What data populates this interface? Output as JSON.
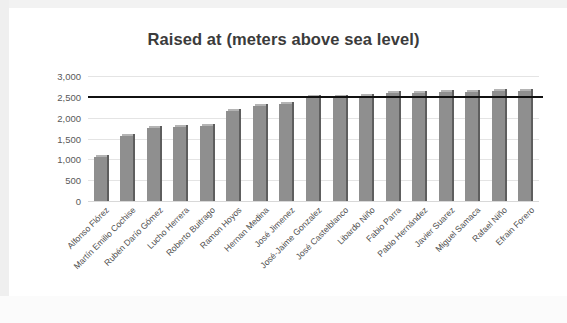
{
  "chart_data": {
    "type": "bar",
    "title": "Raised at (meters above sea level)",
    "xlabel": "",
    "ylabel": "",
    "ylim": [
      0,
      3000
    ],
    "ytick_step": 500,
    "ytick_labels": [
      "3,000",
      "2,500",
      "2,000",
      "1,500",
      "1,000",
      "500",
      "0"
    ],
    "ytick_values": [
      3000,
      2500,
      2000,
      1500,
      1000,
      500,
      0
    ],
    "grid": true,
    "legend": "none",
    "categories": [
      "Alfonso Flórez",
      "Martín Emilio Cochise",
      "Rubén Darío Gómez",
      "Lucho Herrera",
      "Roberto Buitrago",
      "Ramon Hoyos",
      "Hernan Medina",
      "José Jimenez",
      "José-Jaime Gonzalez",
      "José Castelblanco",
      "Libardo Niño",
      "Fabio  Parra",
      "Pablo Hernández",
      "Javier Suarez",
      "Miguel Samaca",
      "Rafael Niño",
      "Efrain Forero"
    ],
    "values": [
      1050,
      1550,
      1760,
      1770,
      1800,
      2150,
      2290,
      2340,
      2500,
      2500,
      2520,
      2600,
      2600,
      2610,
      2620,
      2630,
      2630
    ],
    "bar_color": "#8f8f8f",
    "bar_edge_color": "#5e5e5e",
    "gridline_color": "#e4e4e4",
    "annotations": [
      {
        "type": "threshold-line",
        "value": 2530,
        "color": "#111111",
        "label": ""
      }
    ]
  },
  "bottom_cut_text": "",
  "colors": {
    "background": "#ffffff",
    "frame": "#efefef",
    "title": "#3b3b3b",
    "axis_text": "#595959"
  }
}
